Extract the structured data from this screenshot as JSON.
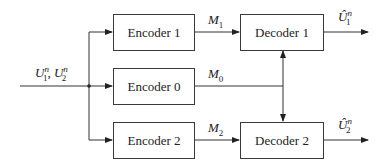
{
  "blocks": {
    "encoder1": "Encoder 1",
    "encoder0": "Encoder 0",
    "encoder2": "Encoder 2",
    "decoder1": "Decoder 1",
    "decoder2": "Decoder 2"
  },
  "signals": {
    "input": {
      "base1": "U",
      "sub1": "1",
      "sup1": "n",
      "sep": ", ",
      "base2": "U",
      "sub2": "2",
      "sup2": "n"
    },
    "m1": {
      "base": "M",
      "sub": "1"
    },
    "m0": {
      "base": "M",
      "sub": "0"
    },
    "m2": {
      "base": "M",
      "sub": "2"
    },
    "out1": {
      "base": "Û",
      "sub": "1",
      "sup": "n"
    },
    "out2": {
      "base": "Û",
      "sub": "2",
      "sup": "n"
    }
  }
}
